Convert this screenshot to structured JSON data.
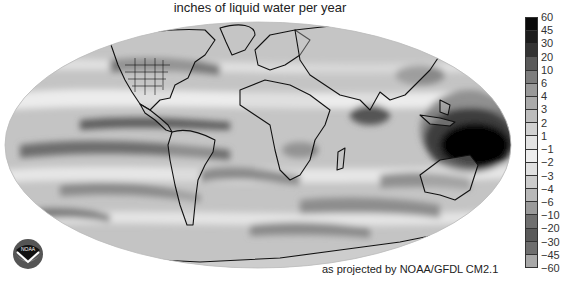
{
  "title": "inches of liquid water per year",
  "credit": "as projected by NOAA/GFDL CM2.1",
  "logo": {
    "name": "noaa-logo",
    "text": "NOAA"
  },
  "colorbar": {
    "labels": [
      "60",
      "45",
      "30",
      "20",
      "10",
      "6",
      "4",
      "3",
      "2",
      "1",
      "−1",
      "−2",
      "−3",
      "−4",
      "−6",
      "−10",
      "−20",
      "−30",
      "−45",
      "−60"
    ],
    "swatches": [
      "#0a0a0a",
      "#1c1c1c",
      "#333333",
      "#5a5a5a",
      "#7d7d7d",
      "#999999",
      "#aaaaaa",
      "#bdbdbd",
      "#d0d0d0",
      "#e2e2e2",
      "#ededed",
      "#e0e0e0",
      "#cccccc",
      "#b8b8b8",
      "#9a9a9a",
      "#6f6f6f",
      "#5a5a5a",
      "#6e6e6e",
      "#a8a8a8"
    ]
  },
  "map": {
    "projection": "Mollweide-like ellipse",
    "colors": {
      "ocean_base": "#c4c4c4",
      "coast": "#111111",
      "wet_max": "#0a0a0a",
      "dry_band": "#7a7a7a",
      "light_band": "#eeeeee"
    }
  }
}
